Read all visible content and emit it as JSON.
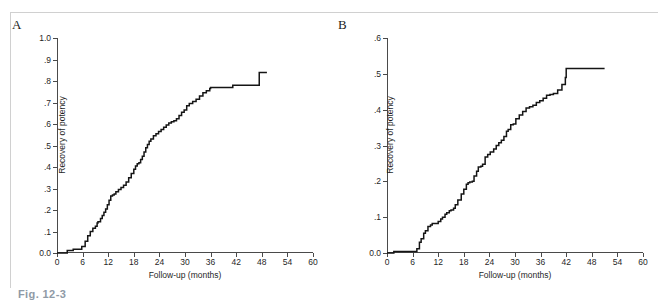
{
  "figure": {
    "caption_partial": "Fig. 12-3",
    "panels": [
      {
        "letter": "A",
        "xlabel": "Follow-up (months)",
        "ylabel": "Recovery of potency",
        "xticks": [
          "0",
          "6",
          "12",
          "18",
          "24",
          "30",
          "36",
          "42",
          "48",
          "54",
          "60"
        ],
        "yticks": [
          "0.0",
          ".1",
          ".2",
          ".3",
          ".4",
          ".5",
          ".6",
          ".7",
          ".8",
          ".9",
          "1.0"
        ]
      },
      {
        "letter": "B",
        "xlabel": "Follow-up (months)",
        "ylabel": "Recovery of potency",
        "xticks": [
          "0",
          "6",
          "12",
          "18",
          "24",
          "30",
          "36",
          "42",
          "48",
          "54",
          "60"
        ],
        "yticks": [
          "0.0",
          ".1",
          ".2",
          ".3",
          ".4",
          ".5",
          ".6"
        ]
      }
    ]
  },
  "chart_data": [
    {
      "type": "line",
      "id": "panel-a",
      "title": "A",
      "xlabel": "Follow-up (months)",
      "ylabel": "Recovery of potency",
      "xlim": [
        0,
        60
      ],
      "ylim": [
        0.0,
        1.0
      ],
      "xticks": [
        0,
        6,
        12,
        18,
        24,
        30,
        36,
        42,
        48,
        54,
        60
      ],
      "yticks": [
        0.0,
        0.1,
        0.2,
        0.3,
        0.4,
        0.5,
        0.6,
        0.7,
        0.8,
        0.9,
        1.0
      ],
      "grid": false,
      "legend": null,
      "step_style": "stepped-kaplan-meier",
      "x": [
        0.0,
        2.2,
        2.4,
        3.6,
        3.8,
        5.6,
        5.8,
        6.6,
        7.2,
        7.8,
        8.4,
        9.0,
        9.4,
        9.6,
        10.2,
        10.6,
        11.0,
        11.4,
        11.8,
        12.2,
        12.6,
        13.0,
        13.4,
        13.8,
        14.4,
        15.0,
        15.6,
        16.2,
        16.8,
        17.4,
        18.0,
        18.4,
        18.8,
        19.2,
        19.6,
        20.0,
        20.4,
        20.8,
        21.2,
        21.6,
        22.0,
        22.6,
        23.2,
        23.8,
        24.4,
        25.0,
        25.6,
        26.2,
        26.8,
        27.4,
        28.0,
        28.6,
        29.2,
        29.8,
        30.4,
        31.0,
        31.8,
        32.6,
        33.4,
        34.2,
        35.0,
        35.8,
        36.0,
        40.8,
        41.2,
        47.2,
        47.4,
        49.2
      ],
      "y": [
        0.0,
        0.0,
        0.012,
        0.012,
        0.018,
        0.018,
        0.03,
        0.055,
        0.08,
        0.1,
        0.115,
        0.125,
        0.14,
        0.145,
        0.16,
        0.175,
        0.19,
        0.205,
        0.225,
        0.245,
        0.265,
        0.27,
        0.275,
        0.285,
        0.295,
        0.305,
        0.315,
        0.33,
        0.35,
        0.37,
        0.39,
        0.405,
        0.415,
        0.42,
        0.435,
        0.45,
        0.47,
        0.49,
        0.505,
        0.52,
        0.53,
        0.545,
        0.555,
        0.565,
        0.575,
        0.585,
        0.595,
        0.605,
        0.61,
        0.615,
        0.625,
        0.64,
        0.655,
        0.665,
        0.685,
        0.695,
        0.705,
        0.715,
        0.73,
        0.745,
        0.755,
        0.765,
        0.77,
        0.77,
        0.78,
        0.78,
        0.84,
        0.84
      ],
      "final_value": 0.84,
      "plateau_start_month": 47.4,
      "curve_end_month": 49.2
    },
    {
      "type": "line",
      "id": "panel-b",
      "title": "B",
      "xlabel": "Follow-up (months)",
      "ylabel": "Recovery of potency",
      "xlim": [
        0,
        60
      ],
      "ylim": [
        0.0,
        0.6
      ],
      "xticks": [
        0,
        6,
        12,
        18,
        24,
        30,
        36,
        42,
        48,
        54,
        60
      ],
      "yticks": [
        0.0,
        0.1,
        0.2,
        0.3,
        0.4,
        0.5,
        0.6
      ],
      "grid": false,
      "legend": null,
      "step_style": "stepped-kaplan-meier",
      "x": [
        0.0,
        1.6,
        6.8,
        7.0,
        7.6,
        8.0,
        8.6,
        9.0,
        9.6,
        10.2,
        10.6,
        11.6,
        12.0,
        12.6,
        13.0,
        13.6,
        14.0,
        14.6,
        15.0,
        15.6,
        16.0,
        16.6,
        17.4,
        18.0,
        18.6,
        19.0,
        19.4,
        20.0,
        20.4,
        21.0,
        21.4,
        22.0,
        22.4,
        23.0,
        23.6,
        24.2,
        25.0,
        25.6,
        26.2,
        26.8,
        27.4,
        28.0,
        28.4,
        29.0,
        29.6,
        30.2,
        31.0,
        31.8,
        32.6,
        33.4,
        34.2,
        35.0,
        35.8,
        36.6,
        37.4,
        38.2,
        39.0,
        40.0,
        41.0,
        41.8,
        42.0,
        51.0
      ],
      "y": [
        0.0,
        0.004,
        0.004,
        0.012,
        0.03,
        0.04,
        0.055,
        0.062,
        0.074,
        0.078,
        0.082,
        0.082,
        0.088,
        0.095,
        0.1,
        0.108,
        0.112,
        0.118,
        0.12,
        0.125,
        0.135,
        0.148,
        0.165,
        0.178,
        0.192,
        0.196,
        0.198,
        0.2,
        0.215,
        0.228,
        0.24,
        0.242,
        0.248,
        0.268,
        0.275,
        0.282,
        0.29,
        0.3,
        0.308,
        0.315,
        0.325,
        0.34,
        0.345,
        0.358,
        0.36,
        0.375,
        0.385,
        0.395,
        0.405,
        0.408,
        0.412,
        0.42,
        0.425,
        0.432,
        0.44,
        0.442,
        0.445,
        0.455,
        0.47,
        0.49,
        0.515,
        0.515
      ],
      "final_value": 0.515,
      "plateau_start_month": 42.0,
      "curve_end_month": 51.0
    }
  ]
}
